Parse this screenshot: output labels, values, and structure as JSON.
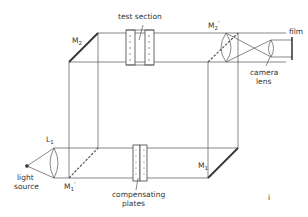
{
  "diagram": {
    "type": "Mach-Zehnder interferometer",
    "labels": {
      "test_section": "test section",
      "m2": "M",
      "m2_sub": "2",
      "m2p": "M",
      "m2p_sub": "2",
      "m2p_prime": "'",
      "m1": "M",
      "m1_sub": "1",
      "m1p": "M",
      "m1p_sub": "1",
      "m1p_prime": "'",
      "l1": "L",
      "l1_sub": "1",
      "film": "film",
      "camera_lens_line1": "camera",
      "camera_lens_line2": "lens",
      "light_source_line1": "light",
      "light_source_line2": "source",
      "compensating_plates_line1": "compensating",
      "compensating_plates_line2": "plates",
      "stray_mark": "i"
    },
    "colors": {
      "line": "#555555",
      "mirror": "#333333",
      "text": "#333333",
      "background": "#ffffff"
    }
  }
}
